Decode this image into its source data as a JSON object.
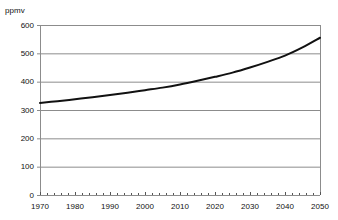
{
  "chart_data": {
    "type": "line",
    "title": "",
    "subtitle": "",
    "xlabel": "",
    "ylabel": "ppmv",
    "unit_label": "ppmv",
    "xlim": [
      1970,
      2050
    ],
    "ylim": [
      0,
      600
    ],
    "grid": true,
    "grid_axis": "y",
    "grid_color": "#8c8c8c",
    "legend": false,
    "legend_position": "none",
    "axis_color": "#8c8c8c",
    "line_color": "#111111",
    "line_width": 2,
    "background_color": "#ffffff",
    "yticks": [
      0,
      100,
      200,
      300,
      400,
      500,
      600
    ],
    "ytick_labels": [
      "0",
      "100",
      "200",
      "300",
      "400",
      "500",
      "600"
    ],
    "xticks": [
      1970,
      1980,
      1990,
      2000,
      2010,
      2020,
      2030,
      2040,
      2050
    ],
    "xtick_labels": [
      "1970",
      "1980",
      "1990",
      "2000",
      "2010",
      "2020",
      "2030",
      "2040",
      "2050"
    ],
    "x_minor_tick_interval": 2,
    "series": [
      {
        "name": "CO2 concentration",
        "x": [
          1970,
          1975,
          1980,
          1985,
          1990,
          1995,
          2000,
          2005,
          2010,
          2015,
          2020,
          2025,
          2030,
          2035,
          2040,
          2045,
          2050
        ],
        "values": [
          325,
          331,
          338,
          345,
          353,
          361,
          370,
          379,
          390,
          403,
          417,
          432,
          450,
          470,
          492,
          521,
          555
        ]
      }
    ],
    "annotations": [
      {
        "text": "crosses 400 ppmv near 2012"
      },
      {
        "text": "crosses 500 ppmv near 2038"
      }
    ]
  },
  "plot_geometry": {
    "left": 40,
    "right": 320,
    "top": 25,
    "bottom": 195
  }
}
